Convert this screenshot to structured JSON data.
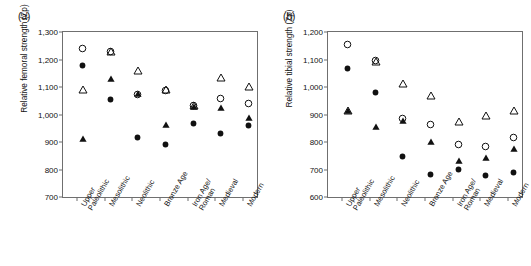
{
  "figure": {
    "panels": [
      {
        "id": "a",
        "label": "(a)",
        "ylabel": "Relative femoral strength (Zp)",
        "ymin": 700,
        "ymax": 1300,
        "ytick_labels": [
          "1,300",
          "1,200",
          "1,100",
          "1,000",
          "900",
          "800",
          "700"
        ],
        "yticks": [
          1300,
          1200,
          1100,
          1000,
          900,
          800,
          700
        ]
      },
      {
        "id": "b",
        "label": "(b)",
        "ylabel": "Relative tibial strength (Zp)",
        "ymin": 600,
        "ymax": 1200,
        "ytick_labels": [
          "1,200",
          "1,100",
          "1,000",
          "900",
          "800",
          "700",
          "600"
        ],
        "yticks": [
          1200,
          1100,
          1000,
          900,
          800,
          700,
          600
        ]
      }
    ],
    "categories": [
      "Upper\nPaleolithic",
      "Mesolithic",
      "Neolithic",
      "Bronze Age",
      "Iron Age/\nRoman",
      "Medieval",
      "Modern"
    ]
  },
  "chart_data": [
    {
      "type": "scatter",
      "panel": "(a)",
      "title": "",
      "xlabel": "",
      "ylabel": "Relative femoral strength (Zp)",
      "ylim": [
        700,
        1300
      ],
      "grid": false,
      "legend": "none",
      "categories": [
        "Upper Paleolithic",
        "Mesolithic",
        "Neolithic",
        "Bronze Age",
        "Iron Age/Roman",
        "Medieval",
        "Modern"
      ],
      "series": [
        {
          "name": "open-circle",
          "marker": "open circle",
          "values": [
            1261,
            1248,
            1093,
            1108,
            1051,
            1077,
            1060
          ]
        },
        {
          "name": "filled-circle",
          "marker": "filled circle",
          "values": [
            1197,
            1075,
            937,
            912,
            986,
            951,
            980
          ]
        },
        {
          "name": "open-triangle",
          "marker": "open triangle",
          "values": [
            1110,
            1250,
            1180,
            1110,
            1052,
            1154,
            1121
          ]
        },
        {
          "name": "filled-triangle",
          "marker": "filled triangle",
          "values": [
            933,
            1150,
            1096,
            983,
            1048,
            1046,
            1008
          ]
        }
      ]
    },
    {
      "type": "scatter",
      "panel": "(b)",
      "title": "",
      "xlabel": "",
      "ylabel": "Relative tibial strength (Zp)",
      "ylim": [
        600,
        1200
      ],
      "grid": false,
      "legend": "none",
      "categories": [
        "Upper Paleolithic",
        "Mesolithic",
        "Neolithic",
        "Bronze Age",
        "Iron Age/Roman",
        "Medieval",
        "Modern"
      ],
      "series": [
        {
          "name": "open-circle",
          "marker": "open circle",
          "values": [
            1176,
            1116,
            904,
            885,
            812,
            805,
            837
          ]
        },
        {
          "name": "filled-circle",
          "marker": "filled circle",
          "values": [
            1089,
            999,
            768,
            701,
            719,
            700,
            710
          ]
        },
        {
          "name": "open-triangle",
          "marker": "open triangle",
          "values": [
            936,
            1113,
            1033,
            988,
            895,
            917,
            936
          ]
        },
        {
          "name": "filled-triangle",
          "marker": "filled triangle",
          "values": [
            936,
            875,
            900,
            823,
            752,
            765,
            796
          ]
        }
      ]
    }
  ],
  "colors": {
    "axis": "#6f6f6f",
    "marker": "#111111",
    "background": "#ffffff"
  }
}
